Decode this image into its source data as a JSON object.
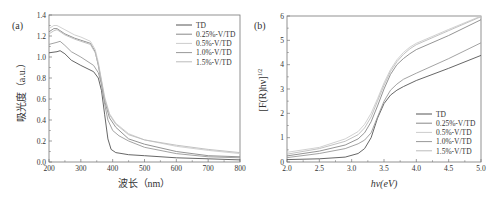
{
  "chart_data": [
    {
      "panel_label": "(a)",
      "type": "line",
      "title": "",
      "xlabel": "波长（nm）",
      "ylabel": "吸光度（a.u.）",
      "xlim": [
        200,
        800
      ],
      "ylim": [
        0.0,
        1.4
      ],
      "xticks": [
        "200",
        "300",
        "400",
        "500",
        "600",
        "700",
        "800"
      ],
      "yticks": [
        "0.0",
        "0.2",
        "0.4",
        "0.6",
        "0.8",
        "1.0",
        "1.2",
        "1.4"
      ],
      "grid": false,
      "legend_position": "upper right",
      "series": [
        {
          "name": "TD",
          "color": "#555555",
          "x": [
            200,
            225,
            235,
            250,
            270,
            300,
            340,
            355,
            365,
            375,
            385,
            395,
            410,
            450,
            500,
            600,
            700,
            800
          ],
          "y": [
            1.04,
            1.05,
            1.06,
            1.03,
            0.97,
            0.92,
            0.86,
            0.8,
            0.68,
            0.45,
            0.22,
            0.12,
            0.09,
            0.07,
            0.06,
            0.04,
            0.03,
            0.02
          ]
        },
        {
          "name": "0.25%-V/TD",
          "color": "#888888",
          "x": [
            200,
            215,
            225,
            250,
            280,
            300,
            330,
            345,
            355,
            365,
            375,
            390,
            410,
            450,
            500,
            600,
            700,
            800
          ],
          "y": [
            1.24,
            1.27,
            1.27,
            1.22,
            1.18,
            1.16,
            1.13,
            1.05,
            0.92,
            0.75,
            0.58,
            0.42,
            0.33,
            0.22,
            0.17,
            0.1,
            0.06,
            0.05
          ]
        },
        {
          "name": "0.5%-V/TD",
          "color": "#cccccc",
          "x": [
            200,
            215,
            225,
            250,
            280,
            300,
            330,
            345,
            355,
            365,
            375,
            390,
            410,
            450,
            500,
            600,
            700,
            800
          ],
          "y": [
            1.27,
            1.3,
            1.3,
            1.26,
            1.21,
            1.19,
            1.15,
            1.07,
            0.95,
            0.78,
            0.62,
            0.46,
            0.37,
            0.27,
            0.21,
            0.15,
            0.11,
            0.08
          ]
        },
        {
          "name": "1.0%-V/TD",
          "color": "#999999",
          "x": [
            200,
            225,
            235,
            250,
            270,
            300,
            340,
            355,
            365,
            375,
            385,
            400,
            420,
            450,
            500,
            600,
            700,
            800
          ],
          "y": [
            1.12,
            1.14,
            1.15,
            1.11,
            1.05,
            1.0,
            0.92,
            0.85,
            0.74,
            0.55,
            0.4,
            0.3,
            0.25,
            0.2,
            0.14,
            0.08,
            0.05,
            0.04
          ]
        },
        {
          "name": "1.5%-V/TD",
          "color": "#bbbbbb",
          "x": [
            200,
            215,
            225,
            250,
            280,
            300,
            330,
            345,
            355,
            365,
            375,
            390,
            410,
            450,
            500,
            600,
            700,
            800
          ],
          "y": [
            1.22,
            1.25,
            1.26,
            1.21,
            1.17,
            1.15,
            1.12,
            1.04,
            0.93,
            0.77,
            0.6,
            0.45,
            0.36,
            0.26,
            0.21,
            0.16,
            0.12,
            0.09
          ]
        }
      ]
    },
    {
      "panel_label": "(b)",
      "type": "line",
      "title": "",
      "xlabel": "hν(eV)",
      "ylabel": "[F(R)hν]^1/2",
      "xlim": [
        2.0,
        5.0
      ],
      "ylim": [
        0,
        6
      ],
      "xticks": [
        "2.0",
        "2.5",
        "3.0",
        "3.5",
        "4.0",
        "4.5",
        "5.0"
      ],
      "yticks": [
        "0",
        "1",
        "2",
        "3",
        "4",
        "5",
        "6"
      ],
      "grid": false,
      "legend_position": "lower right",
      "series": [
        {
          "name": "TD",
          "color": "#555555",
          "x": [
            2.0,
            2.5,
            2.9,
            3.1,
            3.2,
            3.3,
            3.4,
            3.5,
            3.6,
            3.7,
            3.8,
            4.0,
            4.5,
            5.0
          ],
          "y": [
            0.1,
            0.13,
            0.2,
            0.35,
            0.55,
            1.0,
            1.8,
            2.4,
            2.75,
            2.95,
            3.1,
            3.35,
            3.85,
            4.38
          ]
        },
        {
          "name": "0.25%-V/TD",
          "color": "#888888",
          "x": [
            2.0,
            2.5,
            2.9,
            3.1,
            3.2,
            3.3,
            3.4,
            3.5,
            3.6,
            3.7,
            3.8,
            3.9,
            4.0,
            4.5,
            5.0
          ],
          "y": [
            0.25,
            0.45,
            0.7,
            0.95,
            1.2,
            1.65,
            2.3,
            3.0,
            3.6,
            4.0,
            4.25,
            4.45,
            4.62,
            5.2,
            5.85
          ]
        },
        {
          "name": "0.5%-V/TD",
          "color": "#cccccc",
          "x": [
            2.0,
            2.5,
            2.9,
            3.1,
            3.2,
            3.3,
            3.4,
            3.5,
            3.6,
            3.7,
            3.8,
            3.9,
            4.0,
            4.5,
            5.0
          ],
          "y": [
            0.4,
            0.6,
            0.95,
            1.25,
            1.55,
            2.0,
            2.6,
            3.25,
            3.8,
            4.2,
            4.5,
            4.72,
            4.88,
            5.45,
            6.0
          ]
        },
        {
          "name": "1.0%-V/TD",
          "color": "#999999",
          "x": [
            2.0,
            2.5,
            2.9,
            3.1,
            3.2,
            3.3,
            3.4,
            3.5,
            3.6,
            3.7,
            3.8,
            4.0,
            4.5,
            5.0
          ],
          "y": [
            0.18,
            0.35,
            0.55,
            0.75,
            0.9,
            1.2,
            1.85,
            2.5,
            2.95,
            3.2,
            3.4,
            3.65,
            4.25,
            4.9
          ]
        },
        {
          "name": "1.5%-V/TD",
          "color": "#bbbbbb",
          "x": [
            2.0,
            2.5,
            2.9,
            3.1,
            3.2,
            3.3,
            3.4,
            3.5,
            3.6,
            3.7,
            3.8,
            3.9,
            4.0,
            4.5,
            5.0
          ],
          "y": [
            0.32,
            0.55,
            0.85,
            1.12,
            1.4,
            1.85,
            2.5,
            3.15,
            3.72,
            4.12,
            4.42,
            4.65,
            4.82,
            5.4,
            5.97
          ]
        }
      ]
    }
  ],
  "panels": {
    "a": {
      "label": "(a)",
      "xlabel": "波长（nm）",
      "ylabel": "吸光度（a.u.）"
    },
    "b": {
      "label": "(b)",
      "xlabel": "hν(eV)",
      "ylabel_main": "[F(R)hν]",
      "ylabel_sup": "1/2"
    }
  }
}
